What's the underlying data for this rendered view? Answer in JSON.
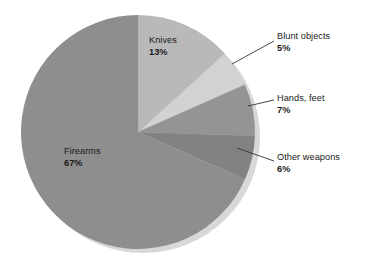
{
  "chart_data": {
    "type": "pie",
    "title": "",
    "subtitle": "",
    "xlabel": "",
    "ylabel": "",
    "legend_position": "none",
    "grid": false,
    "units": "percent",
    "start_angle_deg": 0,
    "direction": "clockwise",
    "categories": [
      "Knives",
      "Blunt objects",
      "Hands, feet",
      "Other weapons",
      "Firearms"
    ],
    "values": [
      13,
      5,
      7,
      6,
      67
    ],
    "slices": [
      {
        "label": "Knives",
        "value": 13,
        "value_text": "13%",
        "color": "#b9b9b9",
        "label_placement": "inside",
        "start_deg": 0,
        "end_deg": 46.8
      },
      {
        "label": "Blunt objects",
        "value": 5,
        "value_text": "5%",
        "color": "#d2d2d2",
        "label_placement": "outside",
        "start_deg": 46.8,
        "end_deg": 64.8
      },
      {
        "label": "Hands, feet",
        "value": 7,
        "value_text": "7%",
        "color": "#949494",
        "label_placement": "outside",
        "start_deg": 64.8,
        "end_deg": 90.0
      },
      {
        "label": "Other weapons",
        "value": 6,
        "value_text": "6%",
        "color": "#828282",
        "label_placement": "outside",
        "start_deg": 90.0,
        "end_deg": 111.6
      },
      {
        "label": "Firearms",
        "value": 67,
        "value_text": "67%",
        "color": "#8e8e8e",
        "label_placement": "inside",
        "start_deg": 111.6,
        "end_deg": 360.0
      }
    ]
  },
  "background_color": "#ffffff",
  "text_color": "#1a1a1a",
  "shadow_color": "#d8d8d8",
  "leader_line_color": "#333333"
}
